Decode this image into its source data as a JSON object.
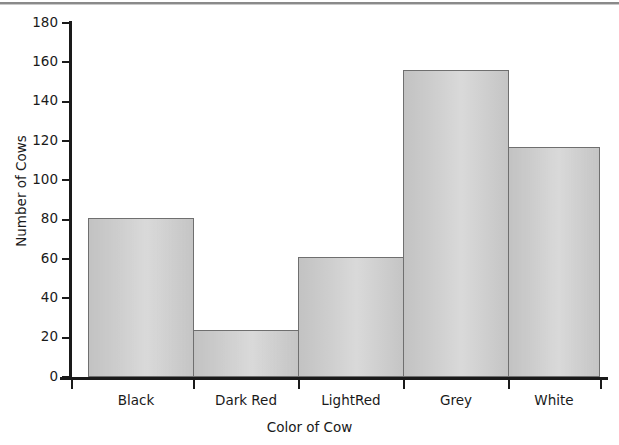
{
  "chart_data": {
    "type": "bar",
    "title": "",
    "subtitle": "",
    "xlabel": "Color of Cow",
    "ylabel": "Number of Cows",
    "categories": [
      "Black",
      "Dark Red",
      "LightRed",
      "Grey",
      "White"
    ],
    "values": [
      81,
      24,
      61,
      156,
      117
    ],
    "series": [
      {
        "name": "Number of Cows",
        "values": [
          81,
          24,
          61,
          156,
          117
        ]
      }
    ],
    "ylim": [
      0,
      180
    ],
    "ytick_labels": [
      "0",
      "20",
      "40",
      "60",
      "80",
      "100",
      "120",
      "140",
      "160",
      "180"
    ],
    "ytick_values": [
      0,
      20,
      40,
      60,
      80,
      100,
      120,
      140,
      160,
      180
    ],
    "ytick_step": 20,
    "grid": false,
    "legend": false,
    "legend_position": "none",
    "bar_style": "contiguous-histogram",
    "colors": {
      "bar_fill": "#cbcbcb",
      "bar_border": "#6f6f6f",
      "axis": "#1a1a1a",
      "text": "#1a1a1a",
      "background": "#ffffff",
      "top_rule": "#8a8a8a"
    }
  }
}
